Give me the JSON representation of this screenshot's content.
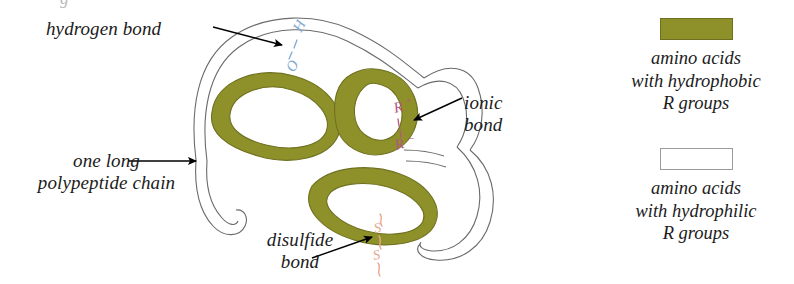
{
  "figure": {
    "type": "biology-diagram",
    "background_color": "#ffffff",
    "top_cropped_glyph": "g"
  },
  "colors": {
    "hydrophobic_fill": "#8e9129",
    "hydrophobic_edge": "#6e7020",
    "hydrophilic_fill": "#ffffff",
    "chain_outline": "#6b6b6b",
    "hydrogen_bond": "#7fa9cf",
    "ionic_bond": "#b5567f",
    "disulfide_bond": "#e8a78c",
    "label_text": "#1c1c1c",
    "arrow": "#000000"
  },
  "labels": {
    "hydrogen_bond": "hydrogen bond",
    "polypeptide_chain": "one long\npolypeptide chain",
    "ionic_bond": "ionic\nbond",
    "disulfide_bond": "disulfide\nbond"
  },
  "bond_annotations": {
    "hydrogen": {
      "atom_top": "H",
      "atom_bottom": "O",
      "connector": "dotted"
    },
    "ionic": {
      "atom_top": "R",
      "charge_top": "+",
      "atom_bottom": "R",
      "charge_bottom": "–",
      "connector": "dotted"
    },
    "disulfide": {
      "atom_top": "S",
      "atom_bottom": "S",
      "connector": "covalent"
    }
  },
  "legend": {
    "entries": [
      {
        "swatch": "olive",
        "swatch_color": "#8e9129",
        "text": "amino acids\nwith hydrophobic\nR groups"
      },
      {
        "swatch": "white",
        "swatch_color": "#ffffff",
        "text": "amino acids\nwith hydrophilic\nR groups"
      }
    ]
  }
}
